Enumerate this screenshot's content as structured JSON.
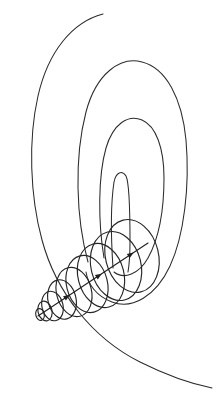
{
  "figure": {
    "type": "line-art-diagram",
    "canvas": {
      "width": 218,
      "height": 403,
      "background": "#ffffff"
    },
    "stroke_color": "#2b2b2b",
    "coil_color": "#252525",
    "axis_color": "#1f1f1f",
    "stroke_width": 1.05
  },
  "contours": {
    "count": 4,
    "description": "Four nested open U-shaped curves opening toward the lower right, drawn as hairpin loops of decreasing size",
    "items": [
      {
        "name": "outer-contour",
        "path": "M 103 14 C 72 22 48 52 38 96 C 28 140 30 196 42 240 C 56 292 92 338 140 362 C 168 376 192 384 212 388"
      },
      {
        "name": "second-contour",
        "path": "M 88 262 C 76 218 74 158 86 112 C 96 74 120 56 142 62 C 166 68 182 98 186 140 C 190 186 184 236 170 266 C 156 296 132 310 112 302 C 96 296 88 284 86 272"
      },
      {
        "name": "third-contour",
        "path": "M 104 258 C 98 222 98 176 106 148 C 113 124 128 114 142 120 C 156 126 164 148 164 178 C 164 212 158 240 148 258 C 139 274 124 280 114 272"
      },
      {
        "name": "inner-sliver",
        "path": "M 113 268 C 111 238 111 202 114 182 C 116 172 122 170 126 176 C 129 182 130 214 130 242 C 130 256 129 266 128 272"
      }
    ]
  },
  "spiral": {
    "name": "expanding-helix",
    "description": "Series of overlapping ellipses increasing in size along a diagonal axis from lower-left convergence point to upper-right",
    "turns": 9,
    "axis": {
      "start": {
        "x": 38,
        "y": 316
      },
      "end": {
        "x": 148,
        "y": 243
      },
      "arrowheads": 3
    },
    "ellipses": [
      {
        "cx": 40.0,
        "cy": 314.5,
        "rx": 4.2,
        "ry": 6.0,
        "rot": -14
      },
      {
        "cx": 45.0,
        "cy": 311.0,
        "rx": 7.0,
        "ry": 10.0,
        "rot": -14
      },
      {
        "cx": 52.5,
        "cy": 306.0,
        "rx": 10.5,
        "ry": 15.0,
        "rot": -14
      },
      {
        "cx": 62.0,
        "cy": 299.5,
        "rx": 14.0,
        "ry": 20.0,
        "rot": -14
      },
      {
        "cx": 74.0,
        "cy": 292.0,
        "rx": 17.5,
        "ry": 25.0,
        "rot": -14
      },
      {
        "cx": 87.0,
        "cy": 284.0,
        "rx": 20.5,
        "ry": 29.0,
        "rot": -14
      },
      {
        "cx": 101.0,
        "cy": 275.5,
        "rx": 23.0,
        "ry": 32.5,
        "rot": -14
      },
      {
        "cx": 116.0,
        "cy": 266.0,
        "rx": 25.0,
        "ry": 35.0,
        "rot": -14
      },
      {
        "cx": 132.0,
        "cy": 256.0,
        "rx": 26.5,
        "ry": 37.0,
        "rot": -14
      }
    ]
  }
}
